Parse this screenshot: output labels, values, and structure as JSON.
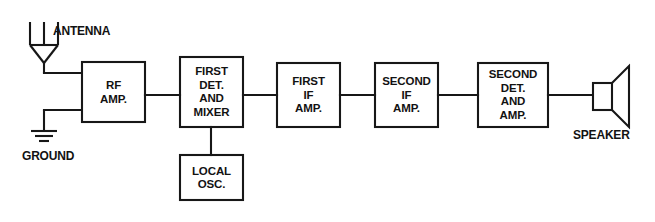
{
  "diagram": {
    "type": "block-diagram",
    "line_color": "#171717",
    "background_color": "#ffffff",
    "text_color": "#121212",
    "blocks": [
      {
        "id": "rf-amp",
        "label": "RF\nAMP.",
        "x": 82,
        "y": 62,
        "w": 63,
        "h": 60
      },
      {
        "id": "first-det",
        "label": "FIRST\nDET.\nAND\nMIXER",
        "x": 180,
        "y": 57,
        "w": 63,
        "h": 70
      },
      {
        "id": "first-if",
        "label": "FIRST\nIF\nAMP.",
        "x": 277,
        "y": 63,
        "w": 63,
        "h": 64
      },
      {
        "id": "second-if",
        "label": "SECOND\nIF\nAMP.",
        "x": 375,
        "y": 63,
        "w": 63,
        "h": 64
      },
      {
        "id": "second-det",
        "label": "SECOND\nDET.\nAND\nAMP.",
        "x": 478,
        "y": 63,
        "w": 70,
        "h": 64
      },
      {
        "id": "local-osc",
        "label": "LOCAL\nOSC.",
        "x": 180,
        "y": 155,
        "w": 63,
        "h": 45
      }
    ],
    "symbols": {
      "antenna": {
        "label": "ANTENNA"
      },
      "ground": {
        "label": "GROUND"
      },
      "speaker": {
        "label": "SPEAKER"
      }
    },
    "signal_path": [
      "ANTENNA",
      "RF AMP.",
      "FIRST DET. AND MIXER",
      "FIRST IF AMP.",
      "SECOND IF AMP.",
      "SECOND DET. AND AMP.",
      "SPEAKER"
    ],
    "branch": {
      "from": "FIRST DET. AND MIXER",
      "to": "LOCAL OSC."
    }
  }
}
